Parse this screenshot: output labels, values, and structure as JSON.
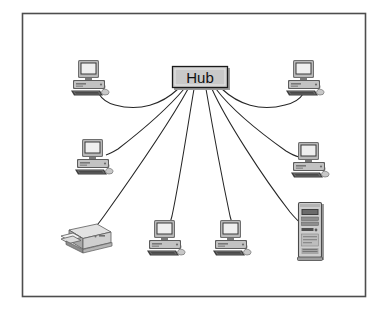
{
  "diagram": {
    "type": "network-topology",
    "topology_name": "star",
    "frame": {
      "present": true,
      "border_color": "#4d4d4d",
      "background": "#ffffff"
    },
    "hub": {
      "label": "Hub",
      "shape": "rectangle",
      "fill": "#c9c9c9",
      "border_color": "#1a1a1a",
      "x": 172,
      "y": 66,
      "width": 56,
      "height": 22,
      "link_count": 8
    },
    "nodes": [
      {
        "id": "pc-top-left",
        "icon": "desktop-computer-icon",
        "label": "",
        "x": 90,
        "y": 78,
        "position": "top-left"
      },
      {
        "id": "pc-top-right",
        "icon": "desktop-computer-icon",
        "label": "",
        "x": 305,
        "y": 78,
        "position": "top-right"
      },
      {
        "id": "pc-middle-left",
        "icon": "desktop-computer-icon",
        "label": "",
        "x": 94,
        "y": 157,
        "position": "middle-left"
      },
      {
        "id": "pc-middle-right",
        "icon": "desktop-computer-icon",
        "label": "",
        "x": 310,
        "y": 160,
        "position": "middle-right"
      },
      {
        "id": "printer-bottom-left",
        "icon": "printer-icon",
        "label": "",
        "x": 87,
        "y": 240,
        "position": "bottom-left"
      },
      {
        "id": "pc-bottom-center-left",
        "icon": "desktop-computer-icon",
        "label": "",
        "x": 166,
        "y": 238,
        "position": "bottom-center-left"
      },
      {
        "id": "pc-bottom-center-right",
        "icon": "desktop-computer-icon",
        "label": "",
        "x": 232,
        "y": 238,
        "position": "bottom-center-right"
      },
      {
        "id": "tower-bottom-right",
        "icon": "tower-server-icon",
        "label": "",
        "x": 310,
        "y": 232,
        "position": "bottom-right"
      }
    ],
    "links": [
      {
        "from": "hub",
        "to": "pc-top-left",
        "style": "curved"
      },
      {
        "from": "hub",
        "to": "pc-top-right",
        "style": "curved"
      },
      {
        "from": "hub",
        "to": "pc-middle-left",
        "style": "curved"
      },
      {
        "from": "hub",
        "to": "pc-middle-right",
        "style": "curved"
      },
      {
        "from": "hub",
        "to": "printer-bottom-left",
        "style": "curved"
      },
      {
        "from": "hub",
        "to": "pc-bottom-center-left",
        "style": "curved"
      },
      {
        "from": "hub",
        "to": "pc-bottom-center-right",
        "style": "curved"
      },
      {
        "from": "hub",
        "to": "tower-bottom-right",
        "style": "curved"
      }
    ],
    "colors": {
      "line": "#262626",
      "frame": "#4d4d4d",
      "hub_fill": "#c9c9c9",
      "icon_dark": "#3a3a3a",
      "icon_mid": "#8f8f8f",
      "icon_light": "#d4d4d4",
      "screen": "#efefef"
    }
  }
}
